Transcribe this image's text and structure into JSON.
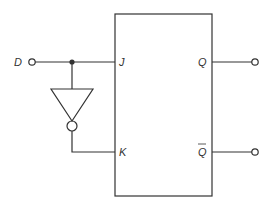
{
  "diagram": {
    "input": {
      "label": "D"
    },
    "flipflop": {
      "inputs": [
        {
          "label": "J"
        },
        {
          "label": "K"
        }
      ],
      "outputs": [
        {
          "label": "Q"
        },
        {
          "label": "Q"
        }
      ],
      "output_bar": [
        false,
        true
      ]
    },
    "inverter": {
      "type": "NOT gate"
    },
    "colors": {
      "line": "#333333",
      "background": "#ffffff"
    }
  }
}
